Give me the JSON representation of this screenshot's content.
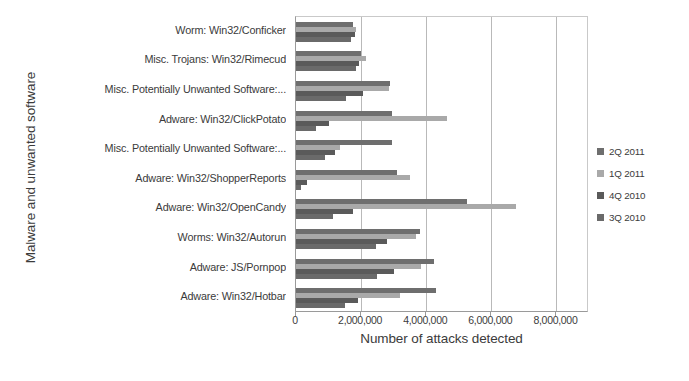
{
  "chart_data": {
    "type": "bar",
    "orientation": "horizontal",
    "title": "",
    "xlabel": "Number of attacks detected",
    "ylabel": "Malware and unwanted software",
    "xlim": [
      0,
      9000000
    ],
    "xticks": [
      0,
      2000000,
      4000000,
      6000000,
      8000000
    ],
    "xtick_labels": [
      "0",
      "2,000,000",
      "4,000,000",
      "6,000,000",
      "8,000,000"
    ],
    "grid": true,
    "legend_position": "right",
    "categories": [
      "Worm: Win32/Conficker",
      "Misc. Trojans: Win32/Rimecud",
      "Misc. Potentially Unwanted Software:...",
      "Adware: Win32/ClickPotato",
      "Misc. Potentially Unwanted Software:...",
      "Adware: Win32/ShopperReports",
      "Adware: Win32/OpenCandy",
      "Worms: Win32/Autorun",
      "Adware: JS/Pornpop",
      "Adware: Win32/Hotbar"
    ],
    "series": [
      {
        "name": "2Q 2011",
        "color": "#6e6e6e",
        "values": [
          1750000,
          2000000,
          2900000,
          2950000,
          2950000,
          3100000,
          5250000,
          3800000,
          4250000,
          4300000
        ]
      },
      {
        "name": "1Q 2011",
        "color": "#a9a9a9",
        "values": [
          1850000,
          2150000,
          2850000,
          4650000,
          1350000,
          3500000,
          6750000,
          3700000,
          3850000,
          3200000
        ]
      },
      {
        "name": "4Q 2010",
        "color": "#5a5a5a",
        "values": [
          1800000,
          1950000,
          2050000,
          1000000,
          1200000,
          350000,
          1750000,
          2800000,
          3000000,
          1900000
        ]
      },
      {
        "name": "3Q 2010",
        "color": "#6a6a6a",
        "values": [
          1700000,
          1850000,
          1550000,
          600000,
          900000,
          150000,
          1150000,
          2450000,
          2500000,
          1500000
        ]
      }
    ]
  },
  "legend": {
    "items": [
      {
        "label": "2Q 2011",
        "color": "#6e6e6e"
      },
      {
        "label": "1Q 2011",
        "color": "#a9a9a9"
      },
      {
        "label": "4Q 2010",
        "color": "#5a5a5a"
      },
      {
        "label": "3Q 2010",
        "color": "#6a6a6a"
      }
    ]
  }
}
